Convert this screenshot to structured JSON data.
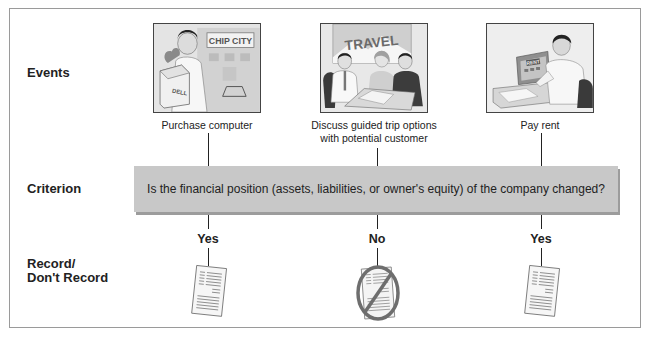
{
  "rows": {
    "events": "Events",
    "criterion": "Criterion",
    "record_line1": "Record/",
    "record_line2": "Don't Record"
  },
  "events": [
    {
      "caption": "Purchase computer",
      "picture_labels": {
        "store_sign": "CHIP CITY",
        "box_label": "DELL"
      },
      "answer": "Yes",
      "outcome": "record-document-icon"
    },
    {
      "caption_line1": "Discuss guided trip options",
      "caption_line2": "with potential customer",
      "picture_labels": {
        "poster": "TRAVEL"
      },
      "answer": "No",
      "outcome": "no-record-document-icon"
    },
    {
      "caption": "Pay rent",
      "picture_labels": {
        "screen": "RENT"
      },
      "answer": "Yes",
      "outcome": "record-document-icon"
    }
  ],
  "criterion_question": "Is the financial position (assets, liabilities, or owner's equity) of the company changed?",
  "colors": {
    "banner": "#c8c8c8",
    "banner_shadow": "#9c9c9c",
    "frame_border": "#9a9a9a",
    "text": "#222222",
    "prohibit_ring": "#6e6e6e"
  }
}
